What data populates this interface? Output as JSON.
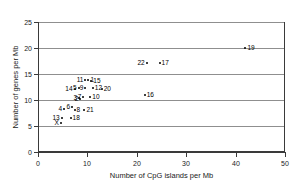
{
  "chart_data": {
    "type": "scatter",
    "title": "",
    "xlabel": "Number of CpG islands per Mb",
    "ylabel": "Number of genes per Mb",
    "xlim": [
      0,
      50
    ],
    "ylim": [
      0,
      25
    ],
    "xticks": [
      0,
      10,
      20,
      30,
      40,
      50
    ],
    "yticks": [
      0,
      5,
      10,
      15,
      20,
      25
    ],
    "grid": "horizontal",
    "legend": "none",
    "point_labels_shown": true,
    "points": [
      {
        "label": "1",
        "x": 10.2,
        "y": 13.9,
        "lpos": "r"
      },
      {
        "label": "2",
        "x": 8.6,
        "y": 10.1,
        "lpos": "l"
      },
      {
        "label": "3",
        "x": 8.3,
        "y": 10.4,
        "lpos": "l"
      },
      {
        "label": "4",
        "x": 5.3,
        "y": 8.2,
        "lpos": "l"
      },
      {
        "label": "5",
        "x": 8.2,
        "y": 12.3,
        "lpos": "l"
      },
      {
        "label": "6",
        "x": 6.9,
        "y": 8.6,
        "lpos": "l"
      },
      {
        "label": "7",
        "x": 9.2,
        "y": 10.6,
        "lpos": "l"
      },
      {
        "label": "8",
        "x": 7.4,
        "y": 8.0,
        "lpos": "r"
      },
      {
        "label": "9",
        "x": 9.6,
        "y": 12.3,
        "lpos": "l"
      },
      {
        "label": "10",
        "x": 10.6,
        "y": 10.6,
        "lpos": "r"
      },
      {
        "label": "11",
        "x": 9.6,
        "y": 13.9,
        "lpos": "l"
      },
      {
        "label": "12",
        "x": 11.1,
        "y": 12.4,
        "lpos": "r"
      },
      {
        "label": "13",
        "x": 4.8,
        "y": 6.6,
        "lpos": "l"
      },
      {
        "label": "14",
        "x": 7.4,
        "y": 12.2,
        "lpos": "l"
      },
      {
        "label": "15",
        "x": 10.8,
        "y": 13.6,
        "lpos": "r"
      },
      {
        "label": "16",
        "x": 21.6,
        "y": 11.0,
        "lpos": "r"
      },
      {
        "label": "17",
        "x": 24.6,
        "y": 17.2,
        "lpos": "r"
      },
      {
        "label": "18",
        "x": 6.6,
        "y": 6.6,
        "lpos": "r"
      },
      {
        "label": "19",
        "x": 42.0,
        "y": 20.0,
        "lpos": "r"
      },
      {
        "label": "20",
        "x": 12.9,
        "y": 12.2,
        "lpos": "r"
      },
      {
        "label": "21",
        "x": 9.4,
        "y": 8.0,
        "lpos": "r"
      },
      {
        "label": "22",
        "x": 22.0,
        "y": 17.2,
        "lpos": "l"
      },
      {
        "label": "X",
        "x": 4.6,
        "y": 5.6,
        "lpos": "l"
      }
    ]
  }
}
